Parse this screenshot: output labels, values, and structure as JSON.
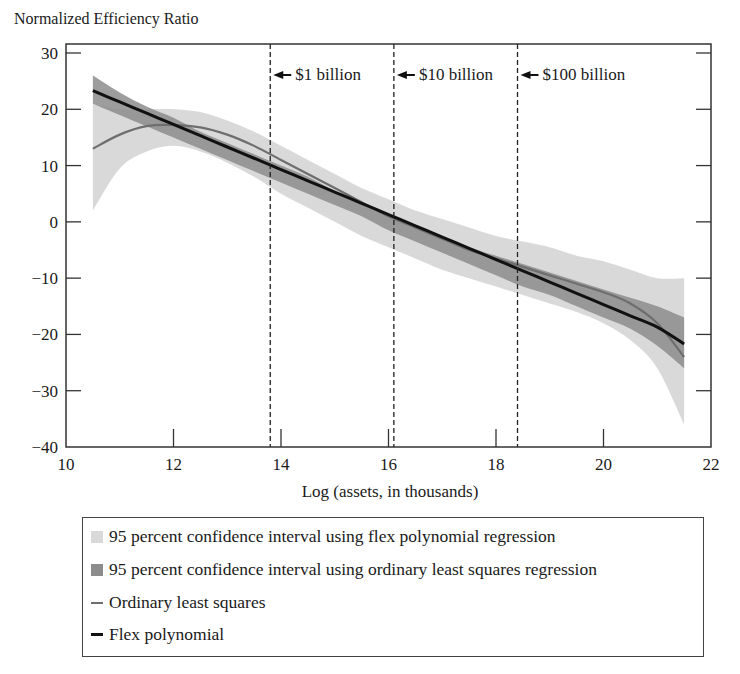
{
  "chart_data": {
    "type": "line",
    "title": "",
    "ylabel": "Normalized Efficiency Ratio",
    "xlabel": "Log (assets, in thousands)",
    "xlim": [
      10,
      22
    ],
    "ylim": [
      -40,
      30
    ],
    "x_ticks": [
      10,
      12,
      14,
      16,
      18,
      20,
      22
    ],
    "y_ticks": [
      30,
      20,
      10,
      0,
      -10,
      -20,
      -30,
      -40
    ],
    "grid": false,
    "legend_position": "below",
    "reference_lines": [
      {
        "x": 13.8,
        "label": "$1 billion",
        "style": "dashed"
      },
      {
        "x": 16.1,
        "label": "$10 billion",
        "style": "dashed"
      },
      {
        "x": 18.4,
        "label": "$100 billion",
        "style": "dashed"
      }
    ],
    "x": [
      10.5,
      11.0,
      11.5,
      12.0,
      12.5,
      13.0,
      13.5,
      14.0,
      14.5,
      15.0,
      15.5,
      16.0,
      16.5,
      17.0,
      17.5,
      18.0,
      18.5,
      19.0,
      19.5,
      20.0,
      20.5,
      21.0,
      21.5
    ],
    "series": [
      {
        "name": "95 percent confidence interval using flex polynomial regression",
        "kind": "band",
        "lower": [
          2.0,
          9.5,
          12.5,
          13.5,
          12.5,
          10.5,
          8.0,
          5.0,
          2.5,
          0.0,
          -2.5,
          -4.5,
          -6.5,
          -8.5,
          -10.0,
          -11.5,
          -13.0,
          -14.5,
          -16.0,
          -18.0,
          -21.0,
          -26.0,
          -36.0
        ],
        "upper": [
          21.0,
          20.0,
          20.0,
          20.0,
          19.5,
          18.0,
          16.0,
          13.5,
          11.0,
          8.5,
          6.0,
          4.0,
          2.0,
          0.5,
          -1.0,
          -2.5,
          -3.5,
          -4.5,
          -6.0,
          -7.0,
          -8.5,
          -10.0,
          -10.0
        ],
        "color": "#d9d9d9"
      },
      {
        "name": "95 percent confidence interval using ordinary least squares regression",
        "kind": "band",
        "lower": [
          21.0,
          19.0,
          17.0,
          15.0,
          13.0,
          11.0,
          9.0,
          7.0,
          5.0,
          3.0,
          1.0,
          -1.5,
          -3.5,
          -5.5,
          -7.5,
          -9.5,
          -11.5,
          -13.0,
          -15.0,
          -17.0,
          -19.0,
          -22.0,
          -26.0
        ],
        "upper": [
          26.0,
          23.0,
          20.5,
          18.5,
          16.0,
          14.0,
          12.0,
          10.0,
          8.0,
          5.5,
          3.5,
          1.5,
          -0.5,
          -2.5,
          -4.5,
          -6.0,
          -7.5,
          -9.0,
          -10.5,
          -12.0,
          -13.5,
          -15.0,
          -17.0
        ],
        "color": "#8c8c8c"
      },
      {
        "name": "Ordinary least squares",
        "kind": "line",
        "values": [
          13.0,
          15.5,
          17.0,
          17.2,
          16.8,
          15.5,
          13.5,
          11.0,
          8.5,
          6.0,
          3.5,
          1.0,
          -1.0,
          -3.0,
          -5.0,
          -6.5,
          -8.0,
          -9.5,
          -11.0,
          -12.5,
          -14.5,
          -18.0,
          -24.0
        ],
        "color": "#6e6e6e"
      },
      {
        "name": "Flex polynomial",
        "kind": "line",
        "values": [
          23.3,
          21.3,
          19.3,
          17.3,
          15.3,
          13.3,
          11.3,
          9.3,
          7.3,
          5.3,
          3.3,
          1.3,
          -0.7,
          -2.7,
          -4.7,
          -6.7,
          -8.7,
          -10.7,
          -12.7,
          -14.7,
          -16.7,
          -18.7,
          -21.7
        ],
        "color": "#111111"
      }
    ]
  },
  "legend": {
    "items": [
      {
        "label": "95 percent confidence interval using flex polynomial regression",
        "kind": "band",
        "color": "#d9d9d9"
      },
      {
        "label": "95 percent confidence interval using ordinary least squares regression",
        "kind": "band",
        "color": "#8c8c8c"
      },
      {
        "label": "Ordinary least squares",
        "kind": "line",
        "color": "#6e6e6e"
      },
      {
        "label": "Flex polynomial",
        "kind": "line",
        "color": "#111111"
      }
    ]
  }
}
